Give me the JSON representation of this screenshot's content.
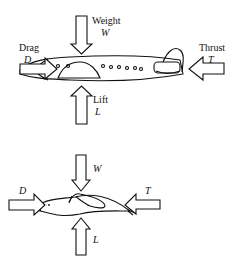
{
  "diagram": {
    "type": "force-diagram",
    "panels": [
      {
        "subject": "airplane",
        "forces": [
          {
            "name": "Weight",
            "symbol": "W",
            "direction": "down"
          },
          {
            "name": "Drag",
            "symbol": "D",
            "direction": "right"
          },
          {
            "name": "Thrust",
            "symbol": "T",
            "direction": "left"
          },
          {
            "name": "Lift",
            "symbol": "L",
            "direction": "up"
          }
        ]
      },
      {
        "subject": "bird",
        "forces": [
          {
            "symbol": "W",
            "direction": "down"
          },
          {
            "symbol": "D",
            "direction": "right"
          },
          {
            "symbol": "T",
            "direction": "left"
          },
          {
            "symbol": "L",
            "direction": "up"
          }
        ]
      }
    ]
  }
}
